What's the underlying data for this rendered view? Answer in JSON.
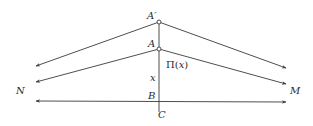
{
  "diagram": {
    "colors": {
      "line": "#3a3a3a",
      "text": "#2a2a2a",
      "background": "#ffffff"
    },
    "points": {
      "A_prime": {
        "label": "A′",
        "x": 159,
        "y": 22
      },
      "A": {
        "label": "A",
        "x": 159,
        "y": 49
      },
      "B": {
        "label": "B",
        "x": 159,
        "y": 101
      },
      "C": {
        "label": "C"
      }
    },
    "labels": {
      "a_prime": "A′",
      "a": "A",
      "b": "B",
      "c": "C",
      "n": "N",
      "m": "M",
      "x": "x",
      "pi_prefix": "Π(",
      "pi_var": "x",
      "pi_suffix": ")"
    },
    "lines": [
      {
        "name": "perpendicular-AC",
        "from": [
          159,
          20
        ],
        "to": [
          159,
          112
        ]
      },
      {
        "name": "ray-Aprime-left",
        "from": [
          159,
          22
        ],
        "to": [
          36,
          66
        ]
      },
      {
        "name": "ray-Aprime-right",
        "from": [
          159,
          22
        ],
        "to": [
          286,
          68
        ]
      },
      {
        "name": "ray-A-left-N",
        "from": [
          159,
          49
        ],
        "to": [
          36,
          82
        ]
      },
      {
        "name": "ray-A-right-M",
        "from": [
          159,
          49
        ],
        "to": [
          286,
          84
        ]
      },
      {
        "name": "line-NM",
        "from": [
          36,
          101
        ],
        "to": [
          286,
          102
        ]
      }
    ]
  }
}
